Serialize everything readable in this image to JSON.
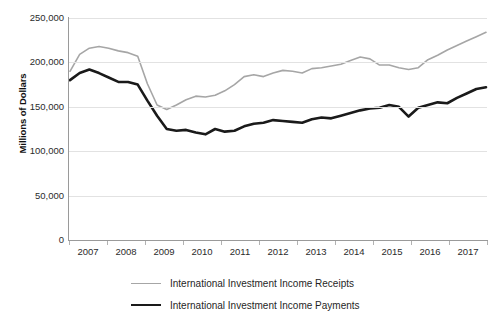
{
  "chart_data": {
    "type": "line",
    "title": "",
    "xlabel": "",
    "ylabel": "Millions of Dollars",
    "ylim": [
      0,
      250000
    ],
    "ytick_labels": [
      "250,000",
      "200,000",
      "150,000",
      "100,000",
      "50,000",
      "0"
    ],
    "ytick_values": [
      250000,
      200000,
      150000,
      100000,
      50000,
      0
    ],
    "xtick_labels": [
      "2007",
      "2008",
      "2009",
      "2010",
      "2011",
      "2012",
      "2013",
      "2014",
      "2015",
      "2016",
      "2017"
    ],
    "xlim": [
      2007,
      2018
    ],
    "grid": true,
    "legend_position": "bottom",
    "frequency": "quarterly",
    "x": [
      "2007Q1",
      "2007Q2",
      "2007Q3",
      "2007Q4",
      "2008Q1",
      "2008Q2",
      "2008Q3",
      "2008Q4",
      "2009Q1",
      "2009Q2",
      "2009Q3",
      "2009Q4",
      "2010Q1",
      "2010Q2",
      "2010Q3",
      "2010Q4",
      "2011Q1",
      "2011Q2",
      "2011Q3",
      "2011Q4",
      "2012Q1",
      "2012Q2",
      "2012Q3",
      "2012Q4",
      "2013Q1",
      "2013Q2",
      "2013Q3",
      "2013Q4",
      "2014Q1",
      "2014Q2",
      "2014Q3",
      "2014Q4",
      "2015Q1",
      "2015Q2",
      "2015Q3",
      "2015Q4",
      "2016Q1",
      "2016Q2",
      "2016Q3",
      "2016Q4",
      "2017Q1",
      "2017Q2",
      "2017Q3",
      "2017Q4"
    ],
    "series": [
      {
        "name": "International Investment Income Receipts",
        "color": "#a6a6a6",
        "width": 1.6,
        "values": [
          190000,
          209000,
          216000,
          218000,
          216000,
          213000,
          211000,
          207000,
          176000,
          152000,
          147000,
          152000,
          158000,
          162000,
          161000,
          163000,
          168000,
          175000,
          184000,
          186000,
          184000,
          188000,
          191000,
          190000,
          188000,
          193000,
          194000,
          196000,
          198000,
          202000,
          206000,
          204000,
          197000,
          197000,
          194000,
          192000,
          194000,
          203000,
          208000,
          214000,
          219000,
          224000,
          229000,
          234000
        ]
      },
      {
        "name": "International Investment Income Payments",
        "color": "#1a1a1a",
        "width": 2.6,
        "values": [
          180000,
          188000,
          192000,
          188000,
          183000,
          178000,
          178000,
          175000,
          157000,
          140000,
          125000,
          123000,
          124000,
          121000,
          119000,
          125000,
          122000,
          123000,
          128000,
          131000,
          132000,
          135000,
          134000,
          133000,
          132000,
          136000,
          138000,
          137000,
          140000,
          143000,
          146000,
          148000,
          149000,
          152000,
          150000,
          139000,
          149000,
          152000,
          155000,
          154000,
          160000,
          165000,
          170000,
          172000
        ]
      }
    ]
  },
  "axis": {
    "y_title": "Millions of Dollars"
  },
  "legend": {
    "items": [
      {
        "label": "International Investment Income Receipts",
        "style": "receipts"
      },
      {
        "label": "International Investment Income Payments",
        "style": "payments"
      }
    ]
  }
}
